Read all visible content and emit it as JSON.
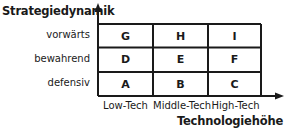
{
  "y_axis": {
    "title": "Strategiedynamik",
    "levels": [
      "vorwärts",
      "bewahrend",
      "defensiv"
    ]
  },
  "x_axis": {
    "title": "Technologiehöhe",
    "levels": [
      "Low-Tech",
      "Middle-Tech",
      "High-Tech"
    ]
  },
  "matrix": {
    "rows": [
      [
        "G",
        "H",
        "I"
      ],
      [
        "D",
        "E",
        "F"
      ],
      [
        "A",
        "B",
        "C"
      ]
    ]
  },
  "colors": {
    "line": "#1a1a1a",
    "text": "#1a1a1a",
    "background": "#ffffff"
  }
}
